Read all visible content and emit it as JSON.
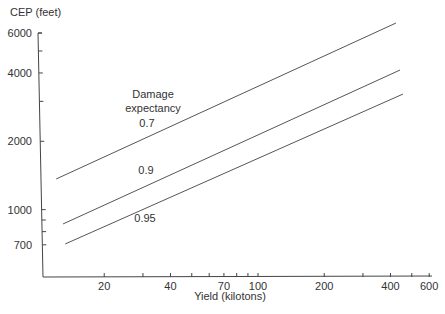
{
  "chart_data": {
    "type": "line",
    "title": "",
    "xlabel": "Yield (kilotons)",
    "ylabel": "CEP (feet)",
    "xscale": "log",
    "yscale": "log",
    "xlim": [
      10.5,
      600
    ],
    "ylim": [
      620,
      6000
    ],
    "grid": false,
    "x_tick_labels": [
      20,
      40,
      70,
      100,
      200,
      400,
      600
    ],
    "x_minor_ticks": [
      30,
      50,
      60,
      80,
      90,
      300,
      500
    ],
    "y_tick_labels": [
      700,
      1000,
      2000,
      4000,
      6000
    ],
    "y_minor_ticks": [
      800,
      900,
      3000,
      5000
    ],
    "legend_title": "Damage expectancy",
    "series": [
      {
        "name": "0.7",
        "x": [
          12.1,
          424
        ],
        "y": [
          1365,
          6640
        ]
      },
      {
        "name": "0.9",
        "x": [
          13.0,
          442
        ],
        "y": [
          865,
          4120
        ]
      },
      {
        "name": "0.95",
        "x": [
          13.3,
          456
        ],
        "y": [
          706,
          3230
        ]
      }
    ],
    "annotations": [
      {
        "text": "Damage",
        "x": 153,
        "y": 98
      },
      {
        "text": "expectancy",
        "x": 153,
        "y": 112
      },
      {
        "text": "0.7",
        "x": 147,
        "y": 127
      },
      {
        "text": "0.9",
        "x": 146,
        "y": 174
      },
      {
        "text": "0.95",
        "x": 145,
        "y": 222
      }
    ]
  },
  "colors": {
    "line": "#555555",
    "axis": "#444444",
    "text": "#333333"
  }
}
